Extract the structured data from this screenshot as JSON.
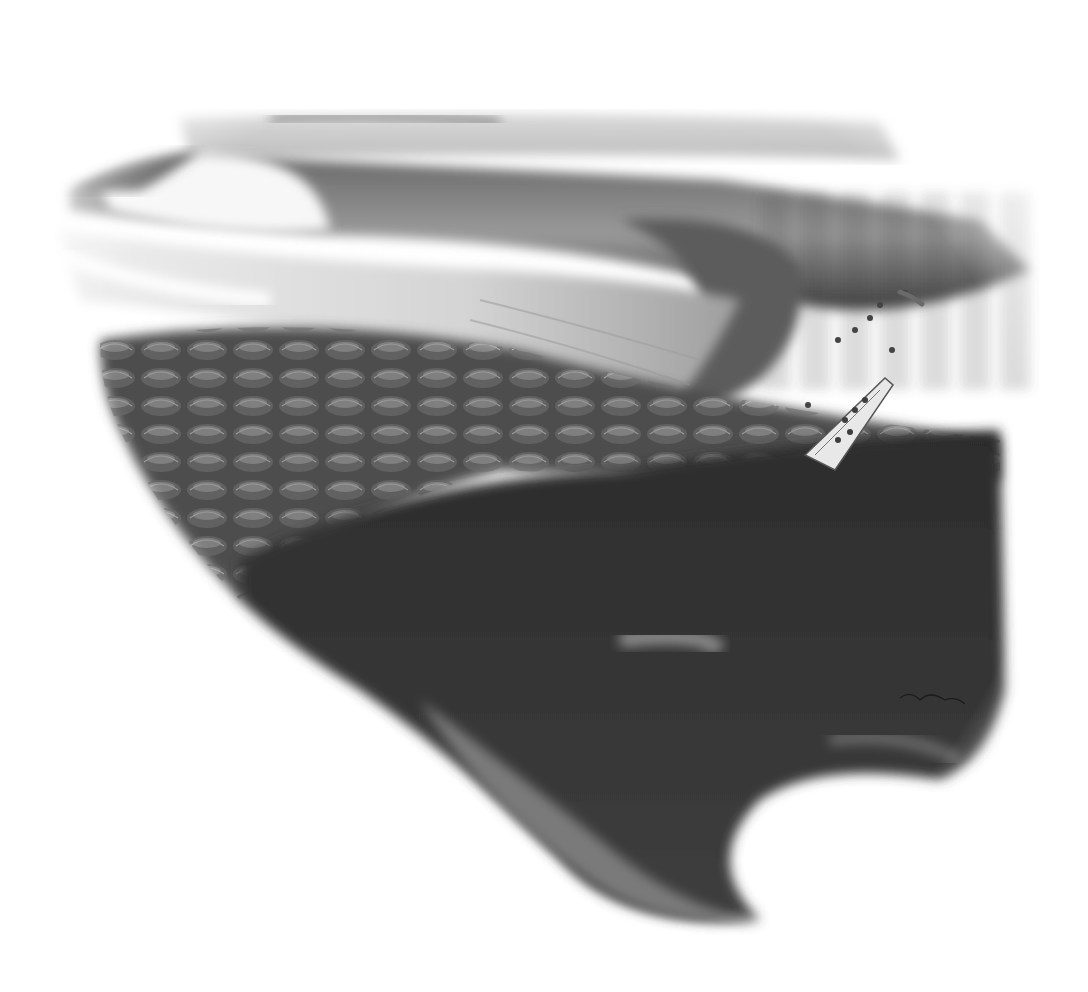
{
  "image": {
    "description": "Graphite pencil illustration of a large barreling wave breaking over a coral reef shelf, with a cross-section showing the reef dropping into deep water; a small boat crowded with people and swimmers sits at the reef edge near the wave's shoulder",
    "medium": "pencil drawing, grayscale",
    "signature": "artist signature (illegible) in lower right of reef wall"
  },
  "palette": {
    "paper": "#ffffff",
    "light_water": "#e6e6e6",
    "mid_gray": "#8c8c8c",
    "reef_dark": "#3a3a3a",
    "deep_shadow": "#242424",
    "foam": "#f6f6f6"
  },
  "elements": {
    "horizon_swell": "distant swell lines on horizon",
    "breaking_wave": "large curling wave with white foam on the left",
    "barrel": "hollow tube of the wave on the right",
    "lagoon": "flat water in front of the wave",
    "reef_top": "coral heads on the shallow reef flat",
    "reef_wall": "dark vertical reef drop-off",
    "sand_channels": "sand spurs descending into the depths",
    "boat": "small white boat loaded with passengers",
    "swimmers": "people in the water beside the boat"
  }
}
